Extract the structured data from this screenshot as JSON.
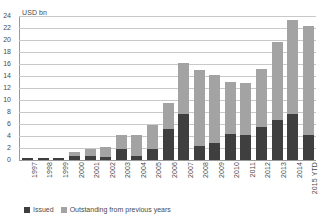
{
  "chart_data": {
    "type": "bar",
    "stacked": true,
    "title": "",
    "subtitle": "",
    "unit_label": "USD bn",
    "xlabel": "",
    "ylabel": "",
    "ylim": [
      0,
      24
    ],
    "ytick_step": 2,
    "yticks": [
      "0",
      "2",
      "4",
      "6",
      "8",
      "10",
      "12",
      "14",
      "16",
      "18",
      "20",
      "22",
      "24"
    ],
    "grid": true,
    "legend_position": "bottom-left",
    "categories": [
      "1997",
      "1998",
      "1999",
      "2000",
      "2001",
      "2002",
      "2003",
      "2004",
      "2005",
      "2006",
      "2007",
      "2008",
      "2009",
      "2010",
      "2011",
      "2012",
      "2013",
      "2014",
      "2015 YTD"
    ],
    "series": [
      {
        "name": "Issued",
        "color": "#3f3f3f",
        "values": [
          0.3,
          0.3,
          0.3,
          0.7,
          0.6,
          0.5,
          1.9,
          0.6,
          1.9,
          5.1,
          7.7,
          2.3,
          2.9,
          4.3,
          4.1,
          5.5,
          6.7,
          7.7,
          4.1
        ]
      },
      {
        "name": "Outstanding from previous years",
        "color": "#a3a3a3",
        "values": [
          0.0,
          0.0,
          0.0,
          0.6,
          1.3,
          1.7,
          2.2,
          3.5,
          4.0,
          4.4,
          8.5,
          12.7,
          11.2,
          8.7,
          8.7,
          9.6,
          13.0,
          15.6,
          18.3
        ]
      }
    ],
    "totals": [
      0.3,
      0.3,
      0.3,
      1.3,
      1.9,
      2.2,
      4.1,
      4.1,
      5.9,
      9.5,
      16.2,
      15.0,
      14.1,
      13.0,
      12.8,
      15.1,
      19.7,
      23.3,
      22.4
    ]
  },
  "legend": {
    "items": [
      {
        "label": "Issued",
        "color": "#3f3f3f"
      },
      {
        "label": "Outstanding from previous years",
        "color": "#a3a3a3"
      }
    ]
  }
}
